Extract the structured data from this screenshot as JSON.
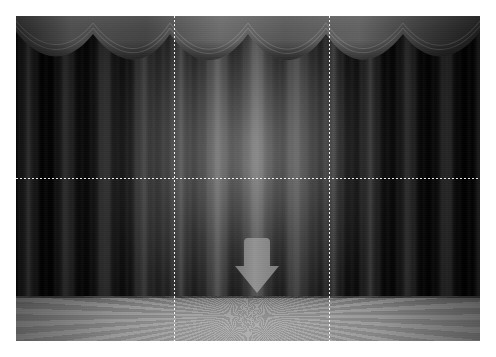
{
  "image": {
    "title": "Theater stage with closed curtains and downward arrow",
    "width": 496,
    "height": 357,
    "border_color": "#ffffff",
    "content_rect": {
      "x": 16,
      "y": 16,
      "width": 464,
      "height": 325
    },
    "palette": "grayscale"
  },
  "scene": {
    "backdrop_label": "dark stage backdrop",
    "backdrop_color": "#000000",
    "curtain": {
      "label": "stage curtain",
      "color_dark": "#0a0a0a",
      "color_mid": "#4a4a4a",
      "color_light": "#9a9a9a",
      "pleat_count": 18
    },
    "valance": {
      "label": "scalloped valance swag",
      "swag_count": 6,
      "color": "#6b6b6b",
      "height_px": 58
    },
    "spotlight": {
      "label": "center spotlight glow",
      "color": "#cfcfcf",
      "center_x_pct": 50,
      "center_y_pct": 44
    },
    "floor": {
      "label": "stage floor",
      "color_near": "#adadad",
      "color_far": "#6f6f6f",
      "ray_count": 112,
      "height_px": 45
    },
    "arrow": {
      "label": "down arrow marker",
      "direction": "down",
      "color": "#8a8a8a",
      "x": 218,
      "y": 220,
      "width": 46,
      "height": 60
    }
  },
  "grid": {
    "label": "rule of thirds guide",
    "style": "dotted",
    "color": "#ffffff",
    "vertical_lines": [
      158,
      313
    ],
    "horizontal_lines": [
      162
    ],
    "columns": 3,
    "rows": 2
  }
}
